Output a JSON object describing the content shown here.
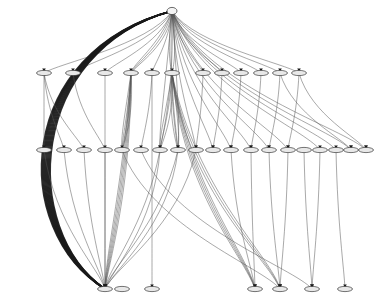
{
  "figure": {
    "kind": "directed-hierarchy-graph",
    "title": "",
    "background_color": "#ffffff",
    "node_fill": "#e8e8e8",
    "node_stroke": "#3a3a3a",
    "edge_color": "#555555",
    "edge_color_bundle": "#1a1a1a",
    "width": 388,
    "height": 298,
    "labels_visible": false
  },
  "chart_data": {
    "type": "diagram",
    "title": "",
    "xlabel": "",
    "ylabel": "",
    "tiers": [
      {
        "name": "tier-0-root",
        "y": 11,
        "count": 1,
        "x": [
          172
        ]
      },
      {
        "name": "tier-1",
        "y": 73,
        "count": 14,
        "x": [
          44,
          73,
          105,
          131,
          152,
          172,
          203,
          222,
          241,
          261,
          280,
          299
        ]
      },
      {
        "name": "tier-2",
        "y": 150,
        "count": 23,
        "x": [
          44,
          64,
          84,
          105,
          122,
          141,
          160,
          178,
          196,
          213,
          231,
          251,
          269,
          288,
          304,
          320,
          336,
          351,
          366
        ]
      },
      {
        "name": "tier-3",
        "y": 289,
        "count": 7,
        "x": [
          105,
          122,
          152,
          255,
          280,
          312,
          345
        ]
      }
    ],
    "edges": [
      {
        "from": [
          172,
          11
        ],
        "to": [
          44,
          73
        ],
        "weight": 1
      },
      {
        "from": [
          172,
          11
        ],
        "to": [
          73,
          73
        ],
        "weight": 1
      },
      {
        "from": [
          172,
          11
        ],
        "to": [
          105,
          73
        ],
        "weight": 1
      },
      {
        "from": [
          172,
          11
        ],
        "to": [
          131,
          73
        ],
        "weight": 3
      },
      {
        "from": [
          172,
          11
        ],
        "to": [
          152,
          73
        ],
        "weight": 1
      },
      {
        "from": [
          172,
          11
        ],
        "to": [
          172,
          73
        ],
        "weight": 2
      },
      {
        "from": [
          172,
          11
        ],
        "to": [
          203,
          73
        ],
        "weight": 1
      },
      {
        "from": [
          172,
          11
        ],
        "to": [
          222,
          73
        ],
        "weight": 1
      },
      {
        "from": [
          172,
          11
        ],
        "to": [
          241,
          73
        ],
        "weight": 1
      },
      {
        "from": [
          172,
          11
        ],
        "to": [
          261,
          73
        ],
        "weight": 1
      },
      {
        "from": [
          172,
          11
        ],
        "to": [
          280,
          73
        ],
        "weight": 1
      },
      {
        "from": [
          172,
          11
        ],
        "to": [
          299,
          73
        ],
        "weight": 1
      },
      {
        "from": [
          172,
          11
        ],
        "to": [
          105,
          289
        ],
        "weight": 9,
        "style": "bundle-left"
      },
      {
        "from": [
          172,
          11
        ],
        "to": [
          160,
          150
        ],
        "weight": 2
      },
      {
        "from": [
          172,
          11
        ],
        "to": [
          178,
          150
        ],
        "weight": 2
      },
      {
        "from": [
          172,
          11
        ],
        "to": [
          196,
          150
        ],
        "weight": 1
      },
      {
        "from": [
          172,
          11
        ],
        "to": [
          213,
          150
        ],
        "weight": 1
      },
      {
        "from": [
          172,
          11
        ],
        "to": [
          231,
          150
        ],
        "weight": 1
      },
      {
        "from": [
          172,
          11
        ],
        "to": [
          251,
          150
        ],
        "weight": 1
      },
      {
        "from": [
          172,
          11
        ],
        "to": [
          269,
          150
        ],
        "weight": 1
      },
      {
        "from": [
          172,
          11
        ],
        "to": [
          288,
          150
        ],
        "weight": 1
      },
      {
        "from": [
          172,
          11
        ],
        "to": [
          320,
          150
        ],
        "weight": 1
      },
      {
        "from": [
          172,
          11
        ],
        "to": [
          336,
          150
        ],
        "weight": 1
      },
      {
        "from": [
          172,
          11
        ],
        "to": [
          351,
          150
        ],
        "weight": 1
      },
      {
        "from": [
          172,
          11
        ],
        "to": [
          366,
          150
        ],
        "weight": 1
      },
      {
        "from": [
          44,
          73
        ],
        "to": [
          44,
          150
        ],
        "weight": 1
      },
      {
        "from": [
          44,
          73
        ],
        "to": [
          64,
          150
        ],
        "weight": 1
      },
      {
        "from": [
          44,
          73
        ],
        "to": [
          84,
          150
        ],
        "weight": 1
      },
      {
        "from": [
          73,
          73
        ],
        "to": [
          105,
          150
        ],
        "weight": 1
      },
      {
        "from": [
          105,
          73
        ],
        "to": [
          105,
          289
        ],
        "weight": 1
      },
      {
        "from": [
          131,
          73
        ],
        "to": [
          122,
          150
        ],
        "weight": 4
      },
      {
        "from": [
          131,
          73
        ],
        "to": [
          105,
          289
        ],
        "weight": 5
      },
      {
        "from": [
          152,
          73
        ],
        "to": [
          141,
          150
        ],
        "weight": 1
      },
      {
        "from": [
          152,
          73
        ],
        "to": [
          152,
          289
        ],
        "weight": 1
      },
      {
        "from": [
          172,
          73
        ],
        "to": [
          160,
          150
        ],
        "weight": 3
      },
      {
        "from": [
          172,
          73
        ],
        "to": [
          178,
          150
        ],
        "weight": 3
      },
      {
        "from": [
          172,
          73
        ],
        "to": [
          255,
          289
        ],
        "weight": 4
      },
      {
        "from": [
          172,
          73
        ],
        "to": [
          280,
          289
        ],
        "weight": 3
      },
      {
        "from": [
          203,
          73
        ],
        "to": [
          196,
          150
        ],
        "weight": 1
      },
      {
        "from": [
          222,
          73
        ],
        "to": [
          213,
          150
        ],
        "weight": 1
      },
      {
        "from": [
          241,
          73
        ],
        "to": [
          231,
          150
        ],
        "weight": 1
      },
      {
        "from": [
          261,
          73
        ],
        "to": [
          251,
          150
        ],
        "weight": 1
      },
      {
        "from": [
          280,
          73
        ],
        "to": [
          269,
          150
        ],
        "weight": 1
      },
      {
        "from": [
          299,
          73
        ],
        "to": [
          288,
          150
        ],
        "weight": 1
      },
      {
        "from": [
          299,
          73
        ],
        "to": [
          366,
          150
        ],
        "weight": 1
      },
      {
        "from": [
          280,
          73
        ],
        "to": [
          351,
          150
        ],
        "weight": 1
      },
      {
        "from": [
          160,
          150
        ],
        "to": [
          105,
          289
        ],
        "weight": 2
      },
      {
        "from": [
          178,
          150
        ],
        "to": [
          105,
          289
        ],
        "weight": 2
      },
      {
        "from": [
          196,
          150
        ],
        "to": [
          105,
          289
        ],
        "weight": 1
      },
      {
        "from": [
          122,
          150
        ],
        "to": [
          280,
          289
        ],
        "weight": 1
      },
      {
        "from": [
          141,
          150
        ],
        "to": [
          312,
          289
        ],
        "weight": 1
      },
      {
        "from": [
          231,
          150
        ],
        "to": [
          255,
          289
        ],
        "weight": 1
      },
      {
        "from": [
          251,
          150
        ],
        "to": [
          255,
          289
        ],
        "weight": 1
      },
      {
        "from": [
          269,
          150
        ],
        "to": [
          280,
          289
        ],
        "weight": 1
      },
      {
        "from": [
          288,
          150
        ],
        "to": [
          280,
          289
        ],
        "weight": 1
      },
      {
        "from": [
          304,
          150
        ],
        "to": [
          312,
          289
        ],
        "weight": 1
      },
      {
        "from": [
          320,
          150
        ],
        "to": [
          312,
          289
        ],
        "weight": 1
      },
      {
        "from": [
          336,
          150
        ],
        "to": [
          345,
          289
        ],
        "weight": 1
      },
      {
        "from": [
          64,
          150
        ],
        "to": [
          105,
          289
        ],
        "weight": 1
      },
      {
        "from": [
          84,
          150
        ],
        "to": [
          105,
          289
        ],
        "weight": 1
      },
      {
        "from": [
          44,
          150
        ],
        "to": [
          105,
          289
        ],
        "weight": 1
      },
      {
        "from": [
          105,
          150
        ],
        "to": [
          105,
          289
        ],
        "weight": 1
      }
    ]
  }
}
